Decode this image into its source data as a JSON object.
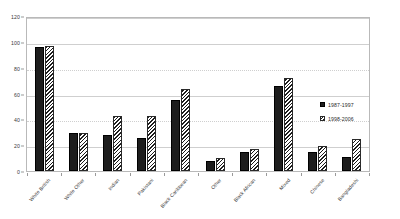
{
  "chart_data": {
    "type": "bar",
    "title": "",
    "subtitle": "",
    "xlabel": "",
    "ylabel": "",
    "ylim": [
      0,
      120
    ],
    "ytick_values": [
      0,
      20,
      40,
      60,
      80,
      100,
      120
    ],
    "ytick_labels": [
      "0",
      "20",
      "40",
      "60",
      "80",
      "100",
      "120"
    ],
    "grid": true,
    "grid_axis": "y",
    "legend_position": "right",
    "categories": [
      "White British",
      "White Other",
      "Indian",
      "Pakistani",
      "Black Caribbean",
      "Other",
      "Black African",
      "Mixed",
      "Chinese",
      "Bangladeshi"
    ],
    "series": [
      {
        "name": "1987-1997",
        "fill": "solid",
        "color": "#1d1d1d",
        "values": [
          97,
          30,
          28,
          26,
          56,
          8,
          15,
          67,
          15,
          11
        ]
      },
      {
        "name": "1998-2006",
        "fill": "diagonal-hatch",
        "color": "#1d1d1d",
        "values": [
          98,
          30,
          43,
          43,
          64,
          10,
          17,
          73,
          20,
          25
        ]
      }
    ]
  },
  "legend": {
    "entries": [
      {
        "label": "1987-1997"
      },
      {
        "label": "1998-2006"
      }
    ]
  },
  "colors": {
    "series_a": "#1d1d1d",
    "series_b": "#1d1d1d",
    "gridline": "#cfcfcf",
    "frame": "#b9b9b9",
    "background": "#ffffff",
    "text": "#3a3a3a"
  }
}
